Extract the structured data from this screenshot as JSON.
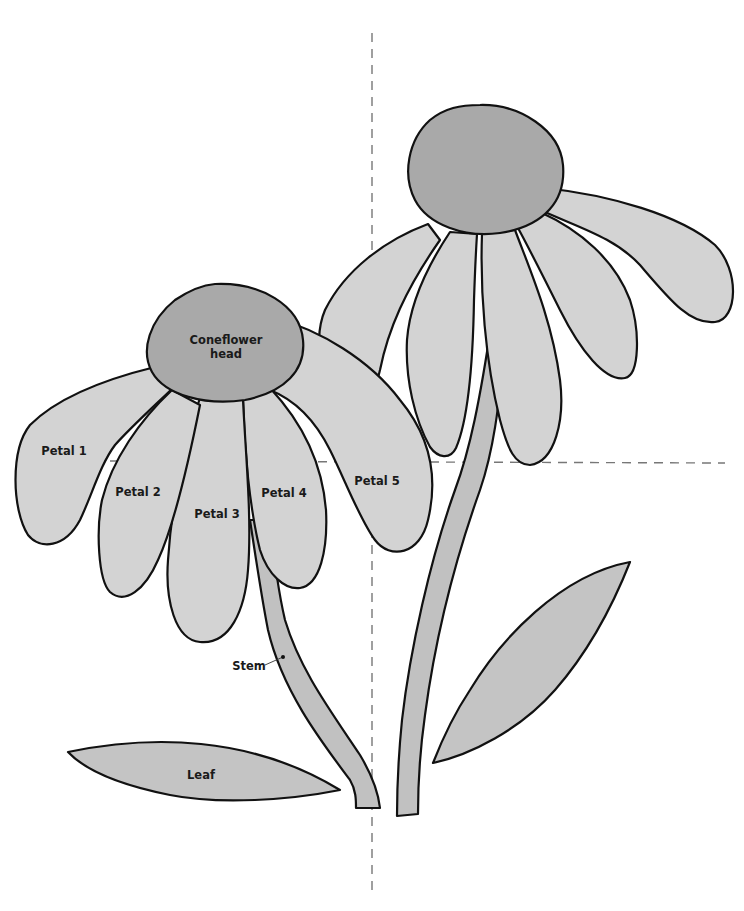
{
  "colors": {
    "petal_fill": "#d3d3d3",
    "head_fill": "#a9a9a9",
    "stem_fill": "#c1c1c1",
    "leaf_fill": "#c4c4c4",
    "outline": "#111111",
    "guide_line": "#777777"
  },
  "labels": {
    "head_line1": "Coneflower",
    "head_line2": "head",
    "petal_1": "Petal 1",
    "petal_2": "Petal 2",
    "petal_3": "Petal 3",
    "petal_4": "Petal 4",
    "petal_5": "Petal 5",
    "stem": "Stem",
    "leaf": "Leaf"
  },
  "guides": {
    "vertical_x": 372,
    "horizontal_y": 462
  }
}
